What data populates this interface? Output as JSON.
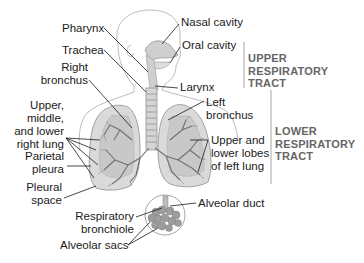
{
  "diagram": {
    "labels": {
      "pharynx": "Pharynx",
      "trachea": "Trachea",
      "right_bronchus": [
        "Right",
        "bronchus"
      ],
      "right_lung": [
        "Upper,",
        "middle,",
        "and lower",
        "right lung"
      ],
      "parietal_pleura": [
        "Parietal",
        "pleura"
      ],
      "pleural_space": [
        "Pleural",
        "space"
      ],
      "nasal_cavity": "Nasal cavity",
      "oral_cavity": "Oral cavity",
      "larynx": "Larynx",
      "left_bronchus": [
        "Left",
        "bronchus"
      ],
      "left_lung": [
        "Upper and",
        "lower lobes",
        "of left lung"
      ],
      "alveolar_duct": "Alveolar duct",
      "respiratory_bronchiole": [
        "Respiratory",
        "bronchiole"
      ],
      "alveolar_sacs": "Alveolar sacs"
    },
    "regions": {
      "upper": [
        "UPPER",
        "RESPIRATORY",
        "TRACT"
      ],
      "lower": [
        "LOWER",
        "RESPIRATORY",
        "TRACT"
      ]
    },
    "colors": {
      "outline": "#b5b5b5",
      "lung_fill": "#d9d9d9",
      "bronchi": "#6e6e6e",
      "leader": "#1a1a1a",
      "region_text": "#666666"
    }
  }
}
